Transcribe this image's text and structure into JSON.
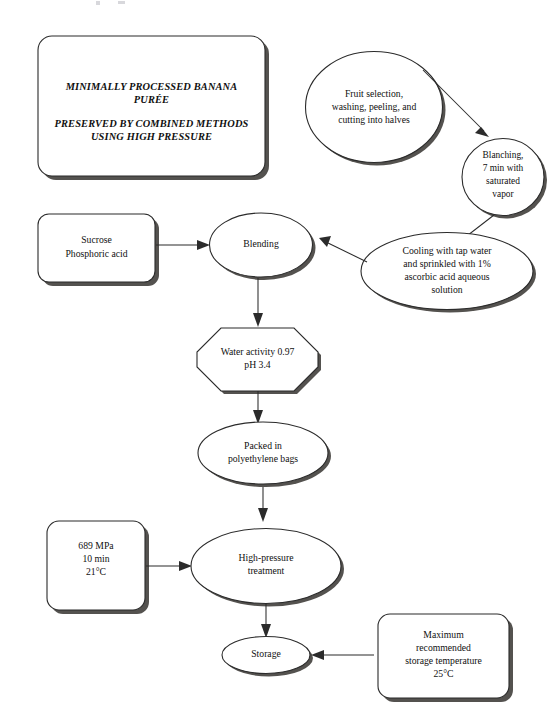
{
  "diagram": {
    "background_color": "#ffffff",
    "line_color": "#2b2b2b",
    "shadow_color": "#54524f",
    "text_color": "#101010"
  },
  "nodes": {
    "title_box": {
      "shape": "rounded-rect",
      "lines": [
        "MINIMALLY PROCESSED BANANA",
        "PURÉE",
        "",
        "PRESERVED BY COMBINED METHODS",
        "USING HIGH PRESSURE"
      ],
      "line1": "MINIMALLY PROCESSED BANANA",
      "line2": "PURÉE",
      "line3": "PRESERVED BY COMBINED METHODS",
      "line4": "USING HIGH PRESSURE"
    },
    "fruit_selection": {
      "shape": "ellipse",
      "line1": "Fruit selection,",
      "line2": "washing, peeling, and",
      "line3": "cutting into halves"
    },
    "blanching": {
      "shape": "ellipse",
      "line1": "Blanching,",
      "line2": "7 min with",
      "line3": "saturated",
      "line4": "vapor"
    },
    "cooling": {
      "shape": "ellipse",
      "line1": "Cooling with tap water",
      "line2": "and sprinkled with 1%",
      "line3": "ascorbic acid aqueous",
      "line4": "solution"
    },
    "additives": {
      "shape": "rounded-rect",
      "line1": "Sucrose",
      "line2": "Phosphoric acid"
    },
    "blending": {
      "shape": "ellipse",
      "line1": "Blending"
    },
    "water_activity": {
      "shape": "octagon",
      "line1": "Water activity 0.97",
      "line2": "pH 3.4"
    },
    "packed": {
      "shape": "ellipse",
      "line1": "Packed in",
      "line2": "polyethylene bags"
    },
    "pressure_params": {
      "shape": "rounded-rect",
      "line1": "689 MPa",
      "line2": "10 min",
      "line3": "21°C"
    },
    "high_pressure": {
      "shape": "ellipse",
      "line1": "High-pressure",
      "line2": "treatment"
    },
    "storage": {
      "shape": "ellipse",
      "line1": "Storage"
    },
    "storage_temp": {
      "shape": "rounded-rect",
      "line1": "Maximum",
      "line2": "recommended",
      "line3": "storage temperature",
      "line4": "25°C"
    }
  },
  "edges": [
    {
      "id": "fruit-to-blanching",
      "from": "fruit_selection",
      "to": "blanching",
      "style": "solid-arrow"
    },
    {
      "id": "blanching-to-cooling",
      "from": "blanching",
      "to": "cooling",
      "style": "solid-arrow"
    },
    {
      "id": "cooling-to-blending",
      "from": "cooling",
      "to": "blending",
      "style": "solid-arrow"
    },
    {
      "id": "additives-to-blending",
      "from": "additives",
      "to": "blending",
      "style": "solid-arrow"
    },
    {
      "id": "blending-to-water-activity",
      "from": "blending",
      "to": "water_activity",
      "style": "solid-arrow"
    },
    {
      "id": "water-activity-to-packed",
      "from": "water_activity",
      "to": "packed",
      "style": "solid-arrow"
    },
    {
      "id": "packed-to-high-pressure",
      "from": "packed",
      "to": "high_pressure",
      "style": "solid-arrow"
    },
    {
      "id": "pressure-params-to-high-pressure",
      "from": "pressure_params",
      "to": "high_pressure",
      "style": "solid-arrow"
    },
    {
      "id": "high-pressure-to-storage",
      "from": "high_pressure",
      "to": "storage",
      "style": "solid-arrow"
    },
    {
      "id": "storage-temp-to-storage",
      "from": "storage_temp",
      "to": "storage",
      "style": "solid-arrow"
    }
  ]
}
